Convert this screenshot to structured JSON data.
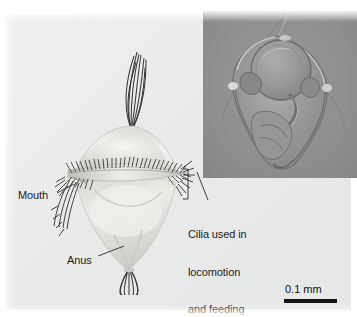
{
  "figure": {
    "kind": "scientific-illustration",
    "background_color": "#eceeee",
    "panel_color": "#e9ebeb"
  },
  "labels": {
    "mouth": "Mouth",
    "anus": "Anus",
    "cilia_line1": "Cilia used in",
    "cilia_line2": "locomotion",
    "cilia_line3": "and feeding",
    "text_color": "#1b1b1b"
  },
  "scale_bar": {
    "value": "0.1 mm",
    "bar_color": "#141414"
  },
  "inset": {
    "name": "light-micrograph",
    "background_color": "#8e8e8e",
    "specimen_color": "#9a9a9a"
  },
  "illustration": {
    "body_color": "#dcdcd8",
    "cilia_color": "#2b2b2b",
    "apical_tuft_color": "#3a3a3a"
  }
}
